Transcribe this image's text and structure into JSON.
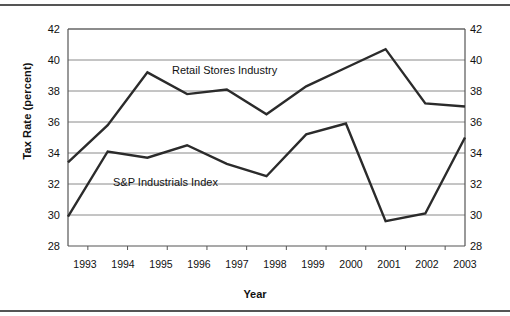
{
  "axis": {
    "ylabel": "Tax Rate (percent)",
    "xlabel": "Year",
    "yticks": [
      "42",
      "40",
      "38",
      "36",
      "34",
      "32",
      "30",
      "28"
    ],
    "xticks": [
      "1993",
      "1994",
      "1995",
      "1996",
      "1997",
      "1998",
      "1999",
      "2000",
      "2001",
      "2002",
      "2003"
    ]
  },
  "labels": {
    "retail": "Retail Stores Industry",
    "snp": "S&P Industrials Index"
  },
  "colors": {
    "line": "#2b2b2b",
    "grid": "#8a8a8a",
    "frame": "#555555",
    "background": "#ffffff"
  },
  "chart_data": {
    "type": "line",
    "title": "",
    "xlabel": "Year",
    "ylabel": "Tax Rate (percent)",
    "x": [
      1993,
      1994,
      1995,
      1996,
      1997,
      1998,
      1999,
      2000,
      2001,
      2002,
      2003
    ],
    "categories": [
      "1993",
      "1994",
      "1995",
      "1996",
      "1997",
      "1998",
      "1999",
      "2000",
      "2001",
      "2002",
      "2003"
    ],
    "series": [
      {
        "name": "Retail Stores Industry",
        "values": [
          33.4,
          35.8,
          39.2,
          37.8,
          38.1,
          36.5,
          38.3,
          39.5,
          40.7,
          37.2,
          37.0
        ]
      },
      {
        "name": "S&P Industrials Index",
        "values": [
          29.9,
          34.1,
          33.7,
          34.5,
          33.3,
          32.5,
          35.2,
          35.9,
          29.6,
          30.1,
          35.0
        ]
      }
    ],
    "ylim": [
      28,
      42
    ],
    "ytick_values": [
      28,
      30,
      32,
      34,
      36,
      38,
      40,
      42
    ],
    "xlim": [
      1993,
      2003
    ],
    "grid": "horizontal",
    "legend": "inline-annotations",
    "dual_y_axis": true
  }
}
